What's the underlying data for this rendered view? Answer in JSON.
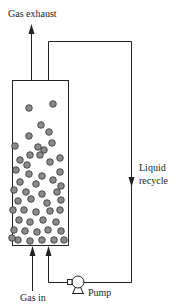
{
  "diagram": {
    "type": "process-flow",
    "labels": {
      "gas_exhaust": "Gas exhaust",
      "liquid_recycle_line1": "Liquid",
      "liquid_recycle_line2": "recycle",
      "pump": "Pump",
      "gas_in": "Gas in"
    },
    "colors": {
      "line": "#222222",
      "particle_fill": "#8a8a8a",
      "particle_stroke": "#333333",
      "background": "#ffffff"
    },
    "particles": [
      [
        53,
        104
      ],
      [
        29,
        108
      ],
      [
        41,
        125
      ],
      [
        49,
        132
      ],
      [
        29,
        136
      ],
      [
        38,
        147
      ],
      [
        15,
        146
      ],
      [
        44,
        150
      ],
      [
        52,
        143
      ],
      [
        30,
        155
      ],
      [
        40,
        155
      ],
      [
        20,
        160
      ],
      [
        60,
        158
      ],
      [
        27,
        165
      ],
      [
        50,
        162
      ],
      [
        16,
        170
      ],
      [
        29,
        174
      ],
      [
        42,
        176
      ],
      [
        60,
        172
      ],
      [
        20,
        182
      ],
      [
        36,
        184
      ],
      [
        53,
        180
      ],
      [
        61,
        186
      ],
      [
        14,
        190
      ],
      [
        26,
        192
      ],
      [
        42,
        194
      ],
      [
        57,
        192
      ],
      [
        18,
        201
      ],
      [
        31,
        199
      ],
      [
        47,
        203
      ],
      [
        61,
        200
      ],
      [
        13,
        210
      ],
      [
        24,
        210
      ],
      [
        36,
        212
      ],
      [
        50,
        211
      ],
      [
        60,
        210
      ],
      [
        19,
        220
      ],
      [
        30,
        222
      ],
      [
        43,
        220
      ],
      [
        56,
        222
      ],
      [
        14,
        230
      ],
      [
        25,
        231
      ],
      [
        37,
        232
      ],
      [
        48,
        230
      ],
      [
        61,
        231
      ],
      [
        18,
        240
      ],
      [
        30,
        241
      ],
      [
        42,
        240
      ],
      [
        54,
        240
      ],
      [
        64,
        240
      ],
      [
        12,
        238
      ]
    ]
  }
}
